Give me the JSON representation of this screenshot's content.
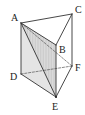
{
  "figure": {
    "type": "triangular-prism",
    "vertices": [
      {
        "name": "A",
        "label": "A"
      },
      {
        "name": "B",
        "label": "B"
      },
      {
        "name": "C",
        "label": "C"
      },
      {
        "name": "D",
        "label": "D"
      },
      {
        "name": "E",
        "label": "E"
      },
      {
        "name": "F",
        "label": "F"
      }
    ],
    "edges_solid": [
      [
        "A",
        "C"
      ],
      [
        "C",
        "B"
      ],
      [
        "A",
        "B"
      ],
      [
        "A",
        "D"
      ],
      [
        "B",
        "E"
      ],
      [
        "C",
        "F"
      ],
      [
        "D",
        "E"
      ],
      [
        "E",
        "F"
      ],
      [
        "A",
        "E"
      ]
    ],
    "edges_hidden": [
      [
        "A",
        "F"
      ],
      [
        "D",
        "F"
      ]
    ],
    "shaded_face": [
      "A",
      "B",
      "E",
      "D"
    ],
    "hatched_region": [
      "A",
      "B",
      "E"
    ]
  }
}
